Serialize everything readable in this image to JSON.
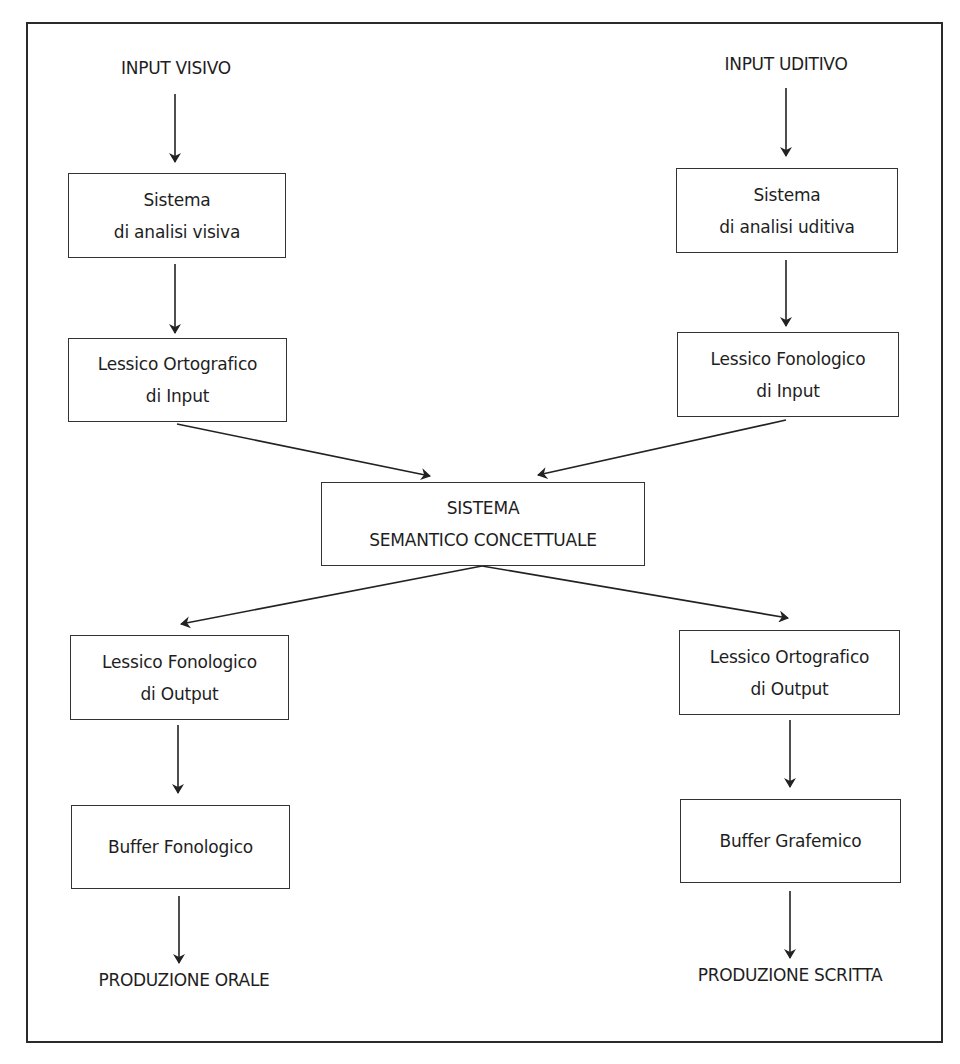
{
  "diagram": {
    "inputs": {
      "visual": "INPUT VISIVO",
      "auditory": "INPUT UDITIVO"
    },
    "left_column": {
      "analysis": [
        "Sistema",
        "di analisi visiva"
      ],
      "input_lexicon": [
        "Lessico Ortografico",
        "di Input"
      ],
      "output_lexicon": [
        "Lessico Fonologico",
        "di Output"
      ],
      "buffer": [
        "Buffer Fonologico"
      ]
    },
    "right_column": {
      "analysis": [
        "Sistema",
        "di analisi uditiva"
      ],
      "input_lexicon": [
        "Lessico Fonologico",
        "di Input"
      ],
      "output_lexicon": [
        "Lessico Ortografico",
        "di Output"
      ],
      "buffer": [
        "Buffer Grafemico"
      ]
    },
    "center": {
      "semantic": [
        "SISTEMA",
        "SEMANTICO CONCETTUALE"
      ]
    },
    "outputs": {
      "oral": "PRODUZIONE ORALE",
      "written": "PRODUZIONE SCRITTA"
    },
    "edges": [
      {
        "from": "INPUT VISIVO",
        "to": "Sistema di analisi visiva"
      },
      {
        "from": "Sistema di analisi visiva",
        "to": "Lessico Ortografico di Input"
      },
      {
        "from": "Lessico Ortografico di Input",
        "to": "SISTEMA SEMANTICO CONCETTUALE"
      },
      {
        "from": "INPUT UDITIVO",
        "to": "Sistema di analisi uditiva"
      },
      {
        "from": "Sistema di analisi uditiva",
        "to": "Lessico Fonologico di Input"
      },
      {
        "from": "Lessico Fonologico di Input",
        "to": "SISTEMA SEMANTICO CONCETTUALE"
      },
      {
        "from": "SISTEMA SEMANTICO CONCETTUALE",
        "to": "Lessico Fonologico di Output"
      },
      {
        "from": "SISTEMA SEMANTICO CONCETTUALE",
        "to": "Lessico Ortografico di Output"
      },
      {
        "from": "Lessico Fonologico di Output",
        "to": "Buffer Fonologico"
      },
      {
        "from": "Buffer Fonologico",
        "to": "PRODUZIONE ORALE"
      },
      {
        "from": "Lessico Ortografico di Output",
        "to": "Buffer Grafemico"
      },
      {
        "from": "Buffer Grafemico",
        "to": "PRODUZIONE SCRITTA"
      }
    ],
    "colors": {
      "line": "#222222",
      "text": "#1e1e1e",
      "background": "#ffffff"
    }
  }
}
